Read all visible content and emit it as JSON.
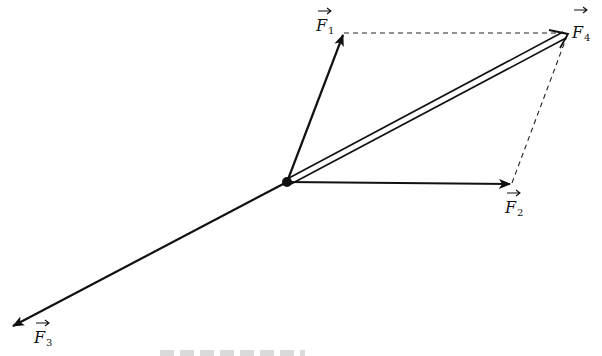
{
  "diagram": {
    "type": "force-vector-parallelogram",
    "origin": {
      "name": "point-of-application"
    },
    "vectors": [
      {
        "id": "F1",
        "letter": "F",
        "subscript": "1",
        "style": "solid-arrow"
      },
      {
        "id": "F2",
        "letter": "F",
        "subscript": "2",
        "style": "solid-arrow"
      },
      {
        "id": "F3",
        "letter": "F",
        "subscript": "3",
        "style": "solid-arrow"
      },
      {
        "id": "F4",
        "letter": "F",
        "subscript": "4",
        "style": "double-line-arrow",
        "role": "resultant of F1 and F2"
      }
    ],
    "construction_lines": [
      {
        "from": "F1",
        "to": "F4",
        "style": "dashed"
      },
      {
        "from": "F2",
        "to": "F4",
        "style": "dashed"
      }
    ],
    "caption": ""
  },
  "colors": {
    "ink": "#111111",
    "background": "#ffffff"
  }
}
